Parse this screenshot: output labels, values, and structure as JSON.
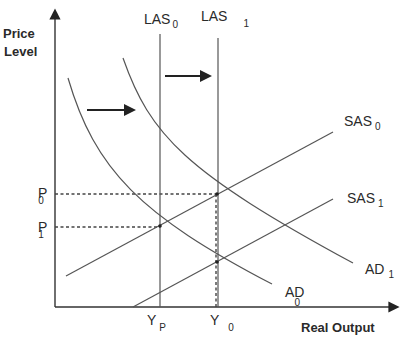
{
  "diagram": {
    "type": "AD-AS macroeconomic model",
    "y_axis_label_line1": "Price",
    "y_axis_label_line2": "Level",
    "x_axis_label": "Real Output",
    "curves": {
      "las0": {
        "label": "LAS",
        "sub": "0"
      },
      "las1": {
        "label": "LAS",
        "sub": "1"
      },
      "sas0": {
        "label": "SAS",
        "sub": "0"
      },
      "sas1": {
        "label": "SAS",
        "sub": "1"
      },
      "ad0": {
        "label": "AD",
        "sub": "0"
      },
      "ad1": {
        "label": "AD",
        "sub": "1"
      }
    },
    "price_levels": {
      "p0": {
        "label": "P",
        "sub": "0"
      },
      "p1": {
        "label": "P",
        "sub": "1"
      }
    },
    "output_levels": {
      "yp": {
        "label": "Y",
        "sub": "P"
      },
      "y0": {
        "label": "Y",
        "sub": "0"
      }
    },
    "shift_arrows": [
      {
        "name": "AD shift right",
        "direction": "right"
      },
      {
        "name": "LAS shift right",
        "direction": "right"
      }
    ],
    "colors": {
      "line": "#555555",
      "axis": "#333333",
      "text": "#2a2a2a",
      "background": "#ffffff"
    }
  }
}
